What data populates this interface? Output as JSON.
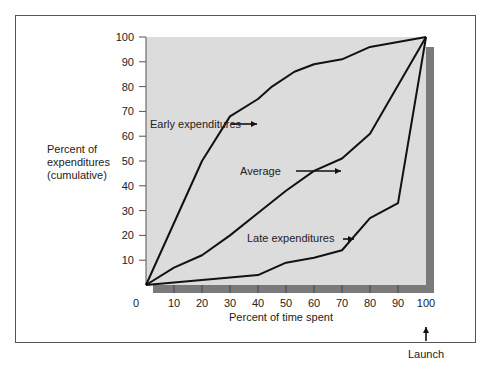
{
  "chart_data": {
    "type": "line",
    "title": "",
    "xlabel": "Percent of time spent",
    "ylabel": "Percent of expenditures (cumulative)",
    "xlim": [
      0,
      100
    ],
    "ylim": [
      0,
      100
    ],
    "x_ticks": [
      "0",
      "10",
      "20",
      "30",
      "40",
      "50",
      "60",
      "70",
      "80",
      "90",
      "100"
    ],
    "y_ticks": [
      "10",
      "20",
      "30",
      "40",
      "50",
      "60",
      "70",
      "80",
      "90",
      "100"
    ],
    "grid": false,
    "series": [
      {
        "name": "Early expenditures",
        "x": [
          0,
          20,
          30,
          40,
          45,
          53,
          60,
          70,
          80,
          85,
          100
        ],
        "y": [
          0,
          50,
          68,
          75,
          80,
          86,
          89,
          91,
          96,
          97,
          100
        ]
      },
      {
        "name": "Average",
        "x": [
          0,
          10,
          20,
          30,
          40,
          50,
          60,
          70,
          80,
          100
        ],
        "y": [
          0,
          7,
          12,
          20,
          29,
          38,
          46,
          51,
          61,
          100
        ]
      },
      {
        "name": "Late expenditures",
        "x": [
          0,
          20,
          40,
          50,
          60,
          70,
          80,
          90,
          100
        ],
        "y": [
          0,
          2,
          4,
          9,
          11,
          14,
          27,
          33,
          100
        ]
      }
    ],
    "annotations": [
      {
        "text": "Early expenditures",
        "arrow_to": [
          45,
          80
        ]
      },
      {
        "text": "Average",
        "arrow_to": [
          60,
          46
        ]
      },
      {
        "text": "Late expenditures",
        "arrow_to": [
          72,
          15
        ]
      },
      {
        "text": "Launch",
        "arrow_to": [
          100,
          0
        ]
      }
    ]
  },
  "labels": {
    "ylabel_line1": "Percent of",
    "ylabel_line2": "expenditures",
    "ylabel_line3": "(cumulative)",
    "xlabel": "Percent of time spent",
    "early": "Early expenditures",
    "average": "Average",
    "late": "Late expenditures",
    "launch": "Launch"
  }
}
